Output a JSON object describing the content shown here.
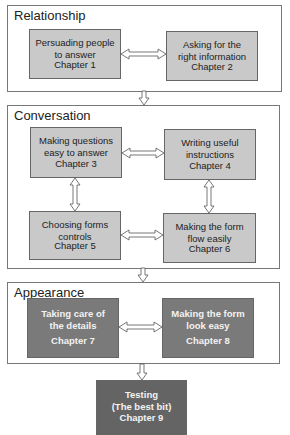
{
  "sections": [
    {
      "title": "Relationship"
    },
    {
      "title": "Conversation"
    },
    {
      "title": "Appearance"
    }
  ],
  "chapters": [
    {
      "title": "Persuading people\nto answer",
      "chapter": "Chapter 1"
    },
    {
      "title": "Asking for the\nright information",
      "chapter": "Chapter 2"
    },
    {
      "title": "Making questions\neasy to answer",
      "chapter": "Chapter 3"
    },
    {
      "title": "Writing useful\ninstructions",
      "chapter": "Chapter 4"
    },
    {
      "title": "Choosing forms\ncontrols",
      "chapter": "Chapter 5"
    },
    {
      "title": "Making the form\nflow easily",
      "chapter": "Chapter 6"
    },
    {
      "title": "Taking care of\nthe details",
      "chapter": "Chapter 7"
    },
    {
      "title": "Making the form\nlook easy",
      "chapter": "Chapter 8"
    },
    {
      "title": "Testing\n(The best bit)",
      "chapter": "Chapter 9"
    }
  ],
  "colors": {
    "light_box": "#c9c9c9",
    "dark_box": "#7a7a7a",
    "darker_box": "#646464",
    "border": "#777777"
  }
}
